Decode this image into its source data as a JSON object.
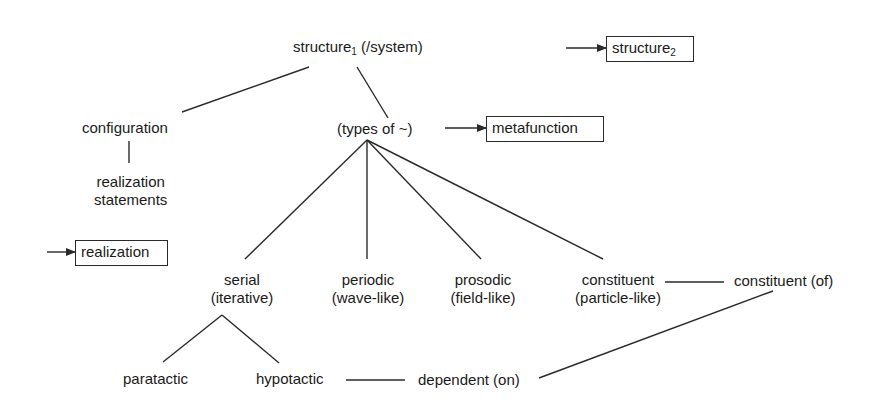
{
  "diagram": {
    "type": "concept-network",
    "nodes": {
      "structure1": {
        "label": "structure",
        "subscript": "1",
        "suffix": " (/system)"
      },
      "structure2": {
        "label": "structure",
        "subscript": "2",
        "boxed": true
      },
      "configuration": {
        "label": "configuration"
      },
      "realization_statements": {
        "line1": "realization",
        "line2": "statements"
      },
      "types_of": {
        "label": "(types of ~)"
      },
      "metafunction": {
        "label": "metafunction",
        "boxed": true
      },
      "realization": {
        "label": "realization",
        "boxed": true
      },
      "serial": {
        "line1": "serial",
        "line2": "(iterative)"
      },
      "periodic": {
        "line1": "periodic",
        "line2": "(wave-like)"
      },
      "prosodic": {
        "line1": "prosodic",
        "line2": "(field-like)"
      },
      "constituent": {
        "line1": "constituent",
        "line2": "(particle-like)"
      },
      "constituent_of": {
        "label": "constituent (of)"
      },
      "paratactic": {
        "label": "paratactic"
      },
      "hypotactic": {
        "label": "hypotactic"
      },
      "dependent_on": {
        "label": "dependent (on)"
      }
    },
    "edges": [
      {
        "from": "structure1",
        "to": "configuration",
        "style": "line"
      },
      {
        "from": "structure1",
        "to": "types_of",
        "style": "line"
      },
      {
        "from": "configuration",
        "to": "realization_statements",
        "style": "line"
      },
      {
        "from": "types_of",
        "to": "serial",
        "style": "line"
      },
      {
        "from": "types_of",
        "to": "periodic",
        "style": "line"
      },
      {
        "from": "types_of",
        "to": "prosodic",
        "style": "line"
      },
      {
        "from": "types_of",
        "to": "constituent",
        "style": "line"
      },
      {
        "from": "serial",
        "to": "paratactic",
        "style": "line"
      },
      {
        "from": "serial",
        "to": "hypotactic",
        "style": "line"
      },
      {
        "from": "constituent",
        "to": "constituent_of",
        "style": "line"
      },
      {
        "from": "hypotactic",
        "to": "dependent_on",
        "style": "line"
      },
      {
        "from": "dependent_on",
        "to": "constituent_of",
        "style": "line"
      },
      {
        "from": "external",
        "to": "structure2",
        "style": "arrow"
      },
      {
        "from": "types_of",
        "to": "metafunction",
        "style": "arrow"
      },
      {
        "from": "external",
        "to": "realization",
        "style": "arrow"
      }
    ],
    "colors": {
      "line": "#2a2a2a",
      "text": "#1a1a1a",
      "background": "#ffffff"
    }
  }
}
